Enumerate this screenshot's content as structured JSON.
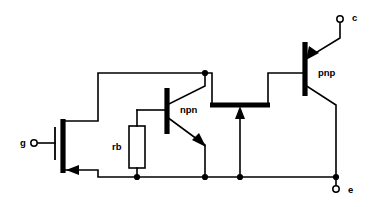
{
  "figure": {
    "type": "schematic-diagram",
    "background_color": "#ffffff",
    "line_color": "#000000",
    "width": 373,
    "height": 207
  },
  "terminals": [
    {
      "id": "gate",
      "label": "g",
      "x": 33,
      "y": 143,
      "label_x": 22,
      "label_y": 143
    },
    {
      "id": "collector",
      "label": "c",
      "x": 340,
      "y": 18,
      "label_x": 352,
      "label_y": 17
    },
    {
      "id": "emitter",
      "label": "e",
      "x": 336,
      "y": 190,
      "label_x": 348,
      "label_y": 190
    }
  ],
  "components": [
    {
      "id": "mosfet",
      "type": "mosfet",
      "label": "",
      "channel_bar_x": 63,
      "channel_bar_y1": 119,
      "channel_bar_y2": 173,
      "gate_bar_x": 55,
      "gate_bar_y1": 127,
      "gate_bar_y2": 160
    },
    {
      "id": "npn",
      "type": "bjt-npn",
      "label": "npn",
      "label_x": 180,
      "label_y": 110,
      "base_bar_x": 167,
      "base_bar_y1": 88,
      "base_bar_y2": 134
    },
    {
      "id": "pnp",
      "type": "bjt-pnp",
      "label": "pnp",
      "label_x": 318,
      "label_y": 73,
      "base_bar_x": 305,
      "base_bar_y1": 42,
      "base_bar_y2": 96
    },
    {
      "id": "rb",
      "type": "resistor",
      "label": "rb",
      "label_x": 117,
      "label_y": 146,
      "box_x": 129,
      "box_y": 125,
      "box_w": 16,
      "box_h": 44
    },
    {
      "id": "body-region",
      "type": "thick-bar",
      "label": "",
      "x1": 210,
      "x2": 270,
      "y": 105
    }
  ],
  "nodes": [
    {
      "id": "node-top-npn-collector",
      "x": 205,
      "y": 73
    },
    {
      "id": "node-rb-bottom",
      "x": 137,
      "y": 177
    },
    {
      "id": "node-npn-emitter-bottom",
      "x": 205,
      "y": 177
    },
    {
      "id": "node-body-bottom",
      "x": 240,
      "y": 177
    },
    {
      "id": "node-emitter-rail",
      "x": 336,
      "y": 177
    }
  ],
  "wires": [
    {
      "id": "mosfet-drain-up",
      "path": "M 63 121 L 98 121 L 98 73 L 205 73"
    },
    {
      "id": "mosfet-source-down",
      "path": "M 63 170 L 98 170 L 98 177 L 336 177"
    },
    {
      "id": "gate-lead",
      "path": "M 38 143 L 55 143"
    },
    {
      "id": "npn-collector-lead",
      "path": "M 167 105 L 205 86 L 205 73"
    },
    {
      "id": "npn-emitter-lead",
      "path": "M 167 117 L 205 145 L 205 177"
    },
    {
      "id": "npn-base-lead",
      "path": "M 137 110 L 167 110"
    },
    {
      "id": "rb-top-lead",
      "path": "M 137 110 L 137 125"
    },
    {
      "id": "rb-bottom-lead",
      "path": "M 137 169 L 137 177"
    },
    {
      "id": "body-bar-left-riser",
      "path": "M 212 105 L 212 73 L 205 73"
    },
    {
      "id": "body-bar-right-riser",
      "path": "M 268 105 L 268 73 L 305 73"
    },
    {
      "id": "body-arrow-stem",
      "path": "M 240 177 L 240 110"
    },
    {
      "id": "pnp-emitter-lead",
      "path": "M 305 58 L 340 38 L 340 22"
    },
    {
      "id": "pnp-collector-lead",
      "path": "M 305 85 L 336 105 L 336 177"
    },
    {
      "id": "emitter-term-lead",
      "path": "M 336 177 L 336 186"
    }
  ],
  "arrows": [
    {
      "id": "mosfet-source-arrow",
      "direction": "left",
      "tip_x": 65,
      "tip_y": 170
    },
    {
      "id": "npn-emitter-arrow",
      "direction": "down-right",
      "tip_x": 205,
      "tip_y": 145
    },
    {
      "id": "pnp-emitter-arrow",
      "direction": "down-left",
      "tip_x": 307,
      "tip_y": 58
    },
    {
      "id": "body-region-arrow",
      "direction": "up",
      "tip_x": 240,
      "tip_y": 107
    }
  ]
}
